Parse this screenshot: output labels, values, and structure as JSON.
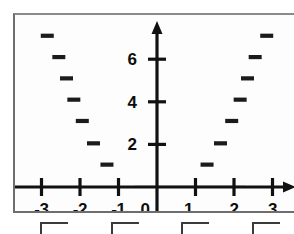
{
  "figure": {
    "name": "coordinate-plane-scatter-plot",
    "background_color": "#ffffff",
    "panel_color": "#fdfdfd",
    "border_color": "#6e6e6e",
    "ink_color": "#111111"
  },
  "axes": {
    "x_axis_name": "x-axis",
    "y_axis_name": "y-axis",
    "x_tick_labels": [
      "-3",
      "-2",
      "-1",
      "0",
      "1",
      "2",
      "3"
    ],
    "x_tick_values": [
      -3,
      -2,
      -1,
      0,
      1,
      2,
      3
    ],
    "origin_label": "0",
    "y_tick_labels": [
      "2",
      "4",
      "6"
    ],
    "y_tick_values": [
      2,
      4,
      6
    ],
    "x_arrow": "right-arrow",
    "y_arrow": "up-arrow"
  },
  "chart_data": {
    "type": "scatter",
    "title": "",
    "subtitle": "",
    "xlabel": "",
    "ylabel": "",
    "xlim": [
      -3.7,
      3.35
    ],
    "ylim": [
      -0.95,
      7.8
    ],
    "grid": false,
    "legend": null,
    "marker_style": "short-horizontal-dash",
    "xticks": [
      -3,
      -2,
      -1,
      0,
      1,
      2,
      3
    ],
    "yticks": [
      2,
      4,
      6
    ],
    "series": [
      {
        "name": "left-branch",
        "points": [
          {
            "x": -2.85,
            "y": 7.1
          },
          {
            "x": -2.55,
            "y": 6.1
          },
          {
            "x": -2.35,
            "y": 5.1
          },
          {
            "x": -2.16,
            "y": 4.1
          },
          {
            "x": -1.94,
            "y": 3.1
          },
          {
            "x": -1.65,
            "y": 2.05
          },
          {
            "x": -1.3,
            "y": 1.05
          }
        ]
      },
      {
        "name": "right-branch",
        "points": [
          {
            "x": 2.85,
            "y": 7.1
          },
          {
            "x": 2.55,
            "y": 6.1
          },
          {
            "x": 2.35,
            "y": 5.1
          },
          {
            "x": 2.16,
            "y": 4.1
          },
          {
            "x": 1.94,
            "y": 3.1
          },
          {
            "x": 1.65,
            "y": 2.05
          },
          {
            "x": 1.3,
            "y": 1.05
          }
        ]
      }
    ]
  },
  "bottom_strip": {
    "name": "answer-choices-cutoff",
    "note": "partially cropped row of answer choices",
    "glyphs": [
      "",
      "",
      "",
      "",
      "",
      ""
    ]
  }
}
